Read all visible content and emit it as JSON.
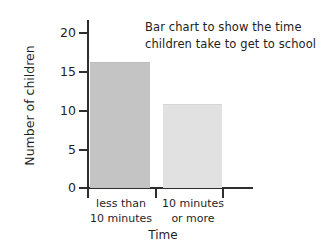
{
  "chart_data": {
    "type": "bar",
    "title": "Bar chart to show the time children take to get to school",
    "title_lines": [
      "Bar chart to show the time",
      "children take to get to school"
    ],
    "categories": [
      "less than 10 minutes",
      "10 minutes or more"
    ],
    "category_lines": [
      [
        "less than",
        "10 minutes"
      ],
      [
        "10 minutes",
        "or more"
      ]
    ],
    "values": [
      16,
      10.7
    ],
    "xlabel": "Time",
    "ylabel": "Number of children",
    "ylim": [
      0,
      20
    ],
    "ytick_values": [
      0,
      5,
      10,
      15,
      20
    ],
    "ytick_labels": [
      "0",
      "5",
      "10",
      "15",
      "20"
    ],
    "grid": false,
    "legend": false,
    "bar_colors": [
      "#c4c4c4",
      "#e1e1e1"
    ],
    "axis_color": "#2e2e2e",
    "background": "#ffffff"
  },
  "axis": {
    "ticks": [
      {
        "label": "0"
      },
      {
        "label": "5"
      },
      {
        "label": "10"
      },
      {
        "label": "15"
      },
      {
        "label": "20"
      }
    ]
  }
}
